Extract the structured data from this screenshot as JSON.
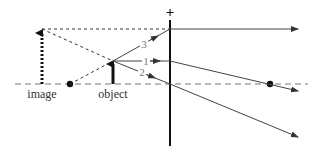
{
  "diagram": {
    "type": "ray-diagram",
    "lens_sign": "+",
    "labels": {
      "image": "image",
      "object": "object",
      "ray1": "1",
      "ray2": "2",
      "ray3": "3"
    },
    "colors": {
      "line": "#222222",
      "ray": "#444444",
      "label": "#333333",
      "ray_number": "#777777",
      "axis": "#666666"
    }
  }
}
